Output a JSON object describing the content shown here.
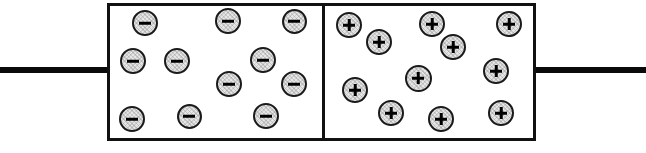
{
  "diagram": {
    "background_color": "#ffffff",
    "line_color": "#111111",
    "carrier_fill_color": "#e6e6e6",
    "carrier_border_color": "#1a1a1a",
    "width": 646,
    "height": 153
  },
  "leads": {
    "left": {
      "label": "left-terminal-wire",
      "x": 0,
      "y": 67,
      "width": 110,
      "height": 6
    },
    "right": {
      "label": "right-terminal-wire",
      "x": 534,
      "y": 67,
      "width": 112,
      "height": 6
    }
  },
  "plates": [
    {
      "id": "negative-plate",
      "polarity": "negative",
      "symbol": "−",
      "carrier_count": 11,
      "x": 107,
      "y": 3,
      "width": 218,
      "height": 138,
      "carriers": [
        {
          "cx": 145,
          "cy": 23,
          "d": 26
        },
        {
          "cx": 228,
          "cy": 21,
          "d": 26
        },
        {
          "cx": 294,
          "cy": 21,
          "d": 25
        },
        {
          "cx": 133,
          "cy": 61,
          "d": 26
        },
        {
          "cx": 177,
          "cy": 61,
          "d": 26
        },
        {
          "cx": 263,
          "cy": 60,
          "d": 26
        },
        {
          "cx": 229,
          "cy": 84,
          "d": 26
        },
        {
          "cx": 294,
          "cy": 84,
          "d": 26
        },
        {
          "cx": 132,
          "cy": 119,
          "d": 26
        },
        {
          "cx": 189,
          "cy": 116,
          "d": 25
        },
        {
          "cx": 266,
          "cy": 116,
          "d": 26
        }
      ]
    },
    {
      "id": "positive-plate",
      "polarity": "positive",
      "symbol": "+",
      "carrier_count": 11,
      "x": 322,
      "y": 3,
      "width": 214,
      "height": 138,
      "carriers": [
        {
          "cx": 349,
          "cy": 25,
          "d": 26
        },
        {
          "cx": 432,
          "cy": 24,
          "d": 26
        },
        {
          "cx": 509,
          "cy": 24,
          "d": 26
        },
        {
          "cx": 379,
          "cy": 42,
          "d": 26
        },
        {
          "cx": 453,
          "cy": 47,
          "d": 26
        },
        {
          "cx": 496,
          "cy": 71,
          "d": 26
        },
        {
          "cx": 418,
          "cy": 78,
          "d": 27
        },
        {
          "cx": 355,
          "cy": 90,
          "d": 26
        },
        {
          "cx": 391,
          "cy": 113,
          "d": 26
        },
        {
          "cx": 441,
          "cy": 119,
          "d": 26
        },
        {
          "cx": 501,
          "cy": 113,
          "d": 26
        }
      ]
    }
  ],
  "divider": {
    "label": "plate-separator",
    "x": 322,
    "y": 3,
    "width": 3,
    "height": 138
  }
}
